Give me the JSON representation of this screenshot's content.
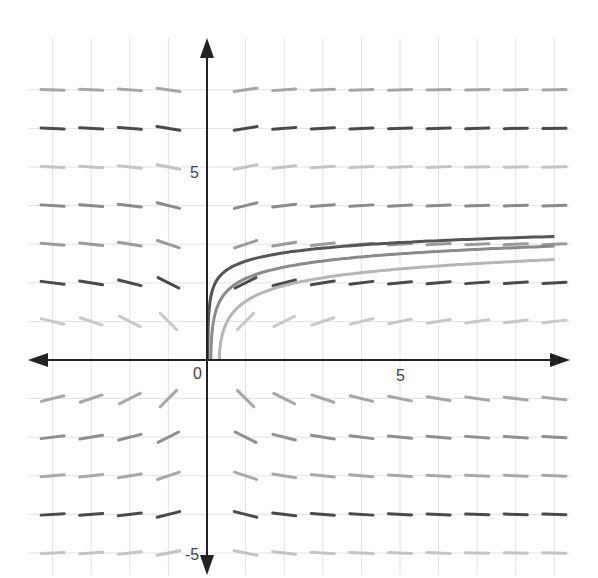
{
  "chart_data": {
    "type": "line",
    "subtype": "slope-field",
    "title": "",
    "xlabel": "",
    "ylabel": "",
    "equation_inferred": "dy/dx = 1/(x*y)",
    "xlim": [
      -4.6,
      9.4
    ],
    "ylim": [
      -5.6,
      8.1
    ],
    "grid": true,
    "legend": null,
    "tick_labels": {
      "origin": "0",
      "x": [
        {
          "value": 5,
          "label": "5"
        }
      ],
      "y": [
        {
          "value": 5,
          "label": "5"
        },
        {
          "value": -5,
          "label": "-5"
        }
      ]
    },
    "slope_field": {
      "x_samples": [
        -4,
        -3,
        -2,
        -1,
        1,
        2,
        3,
        4,
        5,
        6,
        7,
        8,
        9
      ],
      "y_samples": [
        -5,
        -4,
        -3,
        -2,
        -1,
        1,
        2,
        3,
        4,
        5,
        6,
        7
      ],
      "segment_length_units": 0.6,
      "row_colors": {
        "-5": "#c4c4c4",
        "-4": "#4a4a4a",
        "-3": "#a8a8a8",
        "-2": "#8f8f8f",
        "-1": "#a6a6a6",
        "1": "#c8c8c8",
        "2": "#4a4a4a",
        "3": "#9a9a9a",
        "4": "#8a8a8a",
        "5": "#c4c4c4",
        "6": "#4a4a4a",
        "7": "#a6a6a6"
      }
    },
    "series": [
      {
        "name": "solution-1",
        "color": "#555555",
        "formula": "y = sqrt(2 ln x + C)",
        "x_start": 0.02,
        "points": [
          [
            0.02,
            0.1
          ],
          [
            0.1,
            1.3
          ],
          [
            0.5,
            2.0
          ],
          [
            1,
            2.25
          ],
          [
            2,
            2.55
          ],
          [
            5,
            2.95
          ],
          [
            9,
            3.2
          ]
        ]
      },
      {
        "name": "solution-2",
        "color": "#8a8a8a",
        "formula": "y = sqrt(2 ln x + C)",
        "x_start": 0.1,
        "points": [
          [
            0.1,
            0.0
          ],
          [
            0.2,
            0.9
          ],
          [
            0.5,
            1.6
          ],
          [
            1,
            2.0
          ],
          [
            2,
            2.3
          ],
          [
            5,
            2.7
          ],
          [
            9,
            2.95
          ]
        ]
      },
      {
        "name": "solution-3",
        "color": "#b5b5b5",
        "formula": "y = sqrt(2 ln x + C)",
        "x_start": 0.32,
        "points": [
          [
            0.32,
            0.0
          ],
          [
            0.5,
            0.9
          ],
          [
            1,
            1.45
          ],
          [
            2,
            1.85
          ],
          [
            5,
            2.3
          ],
          [
            9,
            2.6
          ]
        ]
      }
    ]
  },
  "plot": {
    "origin_px": [
      207,
      360
    ],
    "unit_px": 38.6,
    "x_axis_px": [
      28,
      570
    ],
    "y_axis_px": [
      38,
      575
    ],
    "grid_x_units": [
      -4,
      -3,
      -2,
      -1,
      0,
      1,
      2,
      3,
      4,
      5,
      6,
      7,
      8,
      9
    ],
    "grid_y_units": [
      -5,
      -4,
      -3,
      -2,
      -1,
      0,
      1,
      2,
      3,
      4,
      5,
      6,
      7
    ],
    "axis_color": "#222222",
    "grid_color": "#e2e2e2"
  }
}
